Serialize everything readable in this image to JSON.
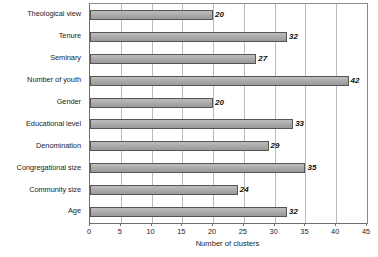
{
  "chart_data": {
    "type": "bar",
    "orientation": "horizontal",
    "title": "",
    "xlabel": "Number of clusters",
    "ylabel": "",
    "xlim": [
      0,
      45
    ],
    "xticks": [
      0,
      5,
      10,
      15,
      20,
      25,
      30,
      35,
      40,
      45
    ],
    "grid": true,
    "legend": false,
    "categories": [
      "Theological view",
      "Tenure",
      "Seminary",
      "Number of youth",
      "Gender",
      "Educational level",
      "Denomination",
      "Congregational size",
      "Community size",
      "Age"
    ],
    "values": [
      20,
      32,
      27,
      42,
      20,
      33,
      29,
      35,
      24,
      32
    ],
    "value_labels": [
      "20",
      "32",
      "27",
      "42",
      "20",
      "33",
      "29",
      "35",
      "24",
      "32"
    ],
    "colors": {
      "bar_fill": "#a9a9a9",
      "bar_border": "#555555",
      "gridline": "#b9b9b9",
      "axis": "#6f6f6f",
      "text": "#1c1c1c",
      "background": "#ffffff"
    }
  }
}
